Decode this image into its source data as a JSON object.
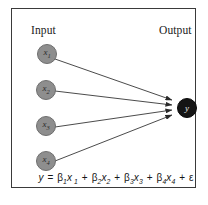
{
  "figure": {
    "type": "neural-network-diagram",
    "frame_color": "#3a3a3a",
    "background": "#ffffff"
  },
  "labels": {
    "input": "Input",
    "output": "Output"
  },
  "nodes": {
    "input_color": "#8e8e8e",
    "output_color": "#151515",
    "inputs": [
      {
        "id": "x1",
        "base": "x",
        "sub": "1"
      },
      {
        "id": "x2",
        "base": "x",
        "sub": "2"
      },
      {
        "id": "x3",
        "base": "x",
        "sub": "3"
      },
      {
        "id": "x4",
        "base": "x",
        "sub": "4"
      }
    ],
    "output": {
      "id": "y",
      "base": "y",
      "sub": ""
    }
  },
  "edges": [
    {
      "from": "x1",
      "to": "y"
    },
    {
      "from": "x2",
      "to": "y"
    },
    {
      "from": "x3",
      "to": "y"
    },
    {
      "from": "x4",
      "to": "y"
    }
  ],
  "equation": {
    "full_text": "y = β1x1 + β2x2 + β3x3 + β4x4 + ε",
    "lhs": "y",
    "equals": "=",
    "terms": [
      {
        "coef": "β",
        "coef_sub": "1",
        "var": "x",
        "var_sub": "1"
      },
      {
        "coef": "β",
        "coef_sub": "2",
        "var": "x",
        "var_sub": "2"
      },
      {
        "coef": "β",
        "coef_sub": "3",
        "var": "x",
        "var_sub": "3"
      },
      {
        "coef": "β",
        "coef_sub": "4",
        "var": "x",
        "var_sub": "4"
      }
    ],
    "plus": "+",
    "error_term": "ε"
  }
}
